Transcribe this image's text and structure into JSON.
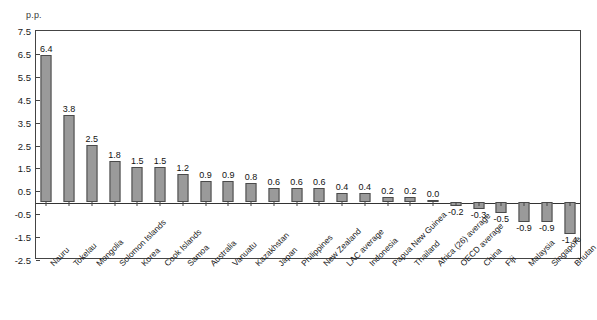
{
  "unit_label": "p.p.",
  "title_partial": "",
  "axis": {
    "y_ticks": [
      7.5,
      6.5,
      5.5,
      4.5,
      3.5,
      2.5,
      1.5,
      0.5,
      -0.5,
      -1.5,
      -2.5
    ],
    "y_tick_labels": [
      "7.5",
      "6.5",
      "5.5",
      "4.5",
      "3.5",
      "2.5",
      "1.5",
      "0.5",
      "-0.5",
      "-1.5",
      "-2.5"
    ]
  },
  "style": {
    "bar_fill": "#9a9a9a",
    "bar_border": "#4a4a4a",
    "frame_color": "#444444",
    "text_color": "#1a1a1a"
  },
  "chart_data": {
    "type": "bar",
    "title": "",
    "xlabel": "",
    "ylabel": "p.p.",
    "ylim": [
      -2.5,
      7.5
    ],
    "ytick_step": 1.0,
    "grid": false,
    "legend": false,
    "categories": [
      "Nauru",
      "Tokelau",
      "Mongolia",
      "Solomon Islands",
      "Korea",
      "Cook Islands",
      "Samoa",
      "Australia",
      "Vanuatu",
      "Kazakhstan",
      "Japan",
      "Philippines",
      "New Zealand",
      "LAC average",
      "Indonesia",
      "Papua New Guinea",
      "Thailand",
      "Africa (26) average",
      "OECD average",
      "China",
      "Fiji",
      "Malaysia",
      "Singapore",
      "Bhutan"
    ],
    "values": [
      6.4,
      3.8,
      2.5,
      1.8,
      1.5,
      1.5,
      1.2,
      0.9,
      0.9,
      0.8,
      0.6,
      0.6,
      0.6,
      0.4,
      0.4,
      0.2,
      0.2,
      0.0,
      -0.2,
      -0.3,
      -0.5,
      -0.9,
      -0.9,
      -1.4
    ],
    "value_labels": [
      "6.4",
      "3.8",
      "2.5",
      "1.8",
      "1.5",
      "1.5",
      "1.2",
      "0.9",
      "0.9",
      "0.8",
      "0.6",
      "0.6",
      "0.6",
      "0.4",
      "0.4",
      "0.2",
      "0.2",
      "0.0",
      "-0.2",
      "-0.3",
      "-0.5",
      "-0.9",
      "-0.9",
      "-1.4"
    ]
  }
}
